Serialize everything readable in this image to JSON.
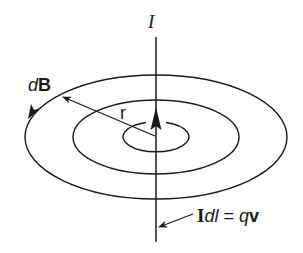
{
  "diagram": {
    "colors": {
      "stroke": "#1a1a1a",
      "background": "#ffffff"
    },
    "labels": {
      "current": "I",
      "field_d": "d",
      "field_B": "B",
      "radius": "r",
      "element_I": "I",
      "element_dl": "dl",
      "element_eq": " = ",
      "element_q": "q",
      "element_v": "v"
    },
    "wire": {
      "x": 156,
      "y_top": 37,
      "y_bottom": 242
    },
    "rings": [
      {
        "name": "outer",
        "cx": 156,
        "cy": 137,
        "rx": 131,
        "ry": 62
      },
      {
        "name": "middle",
        "cx": 156,
        "cy": 137,
        "rx": 83,
        "ry": 37
      },
      {
        "name": "inner",
        "cx": 156,
        "cy": 137,
        "rx": 33,
        "ry": 15
      }
    ]
  }
}
